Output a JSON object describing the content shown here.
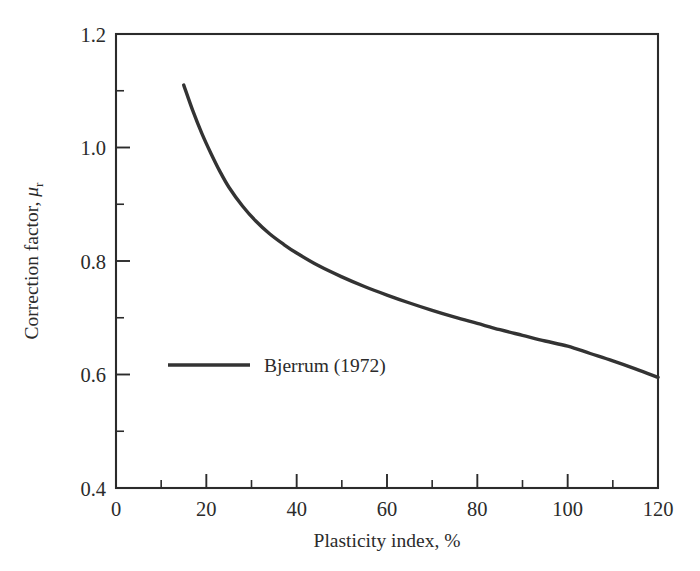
{
  "figure": {
    "background_color": "#ffffff",
    "ink_color": "#2b2b2b",
    "curve_color": "#333333"
  },
  "chart_data": {
    "type": "line",
    "title": "",
    "subtitle": "",
    "xlabel": "Plasticity index, %",
    "ylabel": "Correction factor, μᵣ",
    "ylabel_main": "Correction factor, ",
    "ylabel_symbol": "μ",
    "ylabel_subscript": "r",
    "xlim": [
      0,
      120
    ],
    "ylim": [
      0.4,
      1.2
    ],
    "x_major_ticks": [
      0,
      20,
      40,
      60,
      80,
      100,
      120
    ],
    "x_minor_ticks": [
      10,
      30,
      50,
      70,
      90,
      110
    ],
    "x_tick_labels": [
      "0",
      "20",
      "40",
      "60",
      "80",
      "100",
      "120"
    ],
    "y_major_ticks": [
      0.4,
      0.6,
      0.8,
      1.0,
      1.2
    ],
    "y_minor_ticks": [
      0.5,
      0.7,
      0.9,
      1.1
    ],
    "y_tick_labels": [
      "0.4",
      "0.6",
      "0.8",
      "1.0",
      "1.2"
    ],
    "grid": false,
    "legend_position": "inside-left",
    "series": [
      {
        "name": "Bjerrum (1972)",
        "x": [
          15,
          17,
          19,
          21,
          23,
          25,
          28,
          31,
          34,
          37,
          40,
          45,
          50,
          55,
          60,
          65,
          70,
          75,
          80,
          85,
          90,
          95,
          100,
          105,
          110,
          115,
          120
        ],
        "values": [
          1.11,
          1.065,
          1.025,
          0.99,
          0.958,
          0.93,
          0.897,
          0.87,
          0.848,
          0.83,
          0.814,
          0.791,
          0.772,
          0.755,
          0.74,
          0.726,
          0.713,
          0.701,
          0.69,
          0.679,
          0.669,
          0.659,
          0.65,
          0.637,
          0.624,
          0.61,
          0.595
        ]
      }
    ],
    "legend_entries": [
      {
        "label": "Bjerrum (1972)",
        "marker": "line",
        "color": "#333333"
      }
    ]
  }
}
